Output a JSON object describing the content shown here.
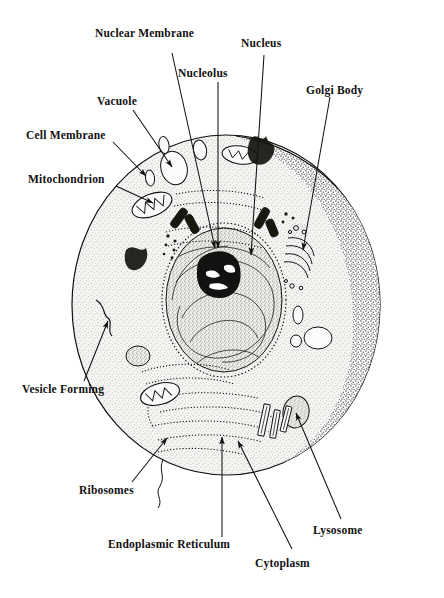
{
  "figure": {
    "kind": "labeled-diagram",
    "background_color": "#ffffff",
    "ink_color": "#111111",
    "cytoplasm_fill": "#f2f2f0",
    "shade_fill": "#cfcfcb"
  },
  "labels": [
    {
      "id": "nuclear-membrane",
      "text": "Nuclear Membrane"
    },
    {
      "id": "nucleus",
      "text": "Nucleus"
    },
    {
      "id": "nucleolus",
      "text": "Nucleolus"
    },
    {
      "id": "golgi-body",
      "text": "Golgi Body"
    },
    {
      "id": "vacuole",
      "text": "Vacuole"
    },
    {
      "id": "cell-membrane",
      "text": "Cell Membrane"
    },
    {
      "id": "mitochondrion",
      "text": "Mitochondrion"
    },
    {
      "id": "vesicle-forming",
      "text": "Vesicle Forming"
    },
    {
      "id": "ribosomes",
      "text": "Ribosomes"
    },
    {
      "id": "endoplasmic-reticulum",
      "text": "Endoplasmic Reticulum"
    },
    {
      "id": "cytoplasm",
      "text": "Cytoplasm"
    },
    {
      "id": "lysosome",
      "text": "Lysosome"
    }
  ],
  "leader_lines": [
    {
      "for": "nuclear-membrane",
      "style": "arrow",
      "from": [
        172,
        53
      ],
      "to": [
        215,
        248
      ]
    },
    {
      "for": "nucleus",
      "style": "arrow",
      "from": [
        264,
        55
      ],
      "to": [
        251,
        255
      ]
    },
    {
      "for": "nucleolus",
      "style": "arrow",
      "from": [
        218,
        82
      ],
      "to": [
        218,
        248
      ]
    },
    {
      "for": "golgi-body",
      "style": "arrow",
      "from": [
        330,
        97
      ],
      "to": [
        303,
        250
      ]
    },
    {
      "for": "vacuole",
      "style": "arrow",
      "from": [
        133,
        110
      ],
      "to": [
        172,
        167
      ]
    },
    {
      "for": "cell-membrane",
      "style": "arrow",
      "from": [
        113,
        142
      ],
      "to": [
        146,
        176
      ]
    },
    {
      "for": "mitochondrion",
      "style": "arrow",
      "from": [
        116,
        186
      ],
      "to": [
        153,
        203
      ]
    },
    {
      "for": "vesicle-forming",
      "style": "arrow",
      "from": [
        84,
        381
      ],
      "to": [
        108,
        321
      ]
    },
    {
      "for": "ribosomes",
      "style": "arrow",
      "from": [
        132,
        482
      ],
      "to": [
        167,
        438
      ]
    },
    {
      "for": "endoplasmic-reticulum",
      "style": "plain-line",
      "from": [
        222,
        537
      ],
      "to": [
        222,
        437
      ]
    },
    {
      "for": "cytoplasm",
      "style": "arrow",
      "from": [
        292,
        549
      ],
      "to": [
        238,
        441
      ]
    },
    {
      "for": "lysosome",
      "style": "arrow",
      "from": [
        341,
        519
      ],
      "to": [
        296,
        413
      ]
    }
  ],
  "organelles": [
    {
      "name": "nucleus",
      "shape": "large central oval"
    },
    {
      "name": "nucleolus",
      "shape": "dark irregular blob inside nucleus"
    },
    {
      "name": "nuclear-membrane",
      "shape": "double dotted envelope around nucleus"
    },
    {
      "name": "golgi-body",
      "shape": "stacked curved membranes with vesicles"
    },
    {
      "name": "endoplasmic-reticulum",
      "shape": "folded studded tubules"
    },
    {
      "name": "mitochondria",
      "shape": "oval bodies with internal cristae"
    },
    {
      "name": "vacuoles",
      "shape": "clear ovals"
    },
    {
      "name": "lysosomes",
      "shape": "small stippled ovals"
    },
    {
      "name": "centrioles",
      "shape": "short dark rods"
    },
    {
      "name": "ribosomes",
      "shape": "small dots along membranes"
    },
    {
      "name": "vesicle-forming",
      "shape": "infolding of cell membrane"
    }
  ]
}
